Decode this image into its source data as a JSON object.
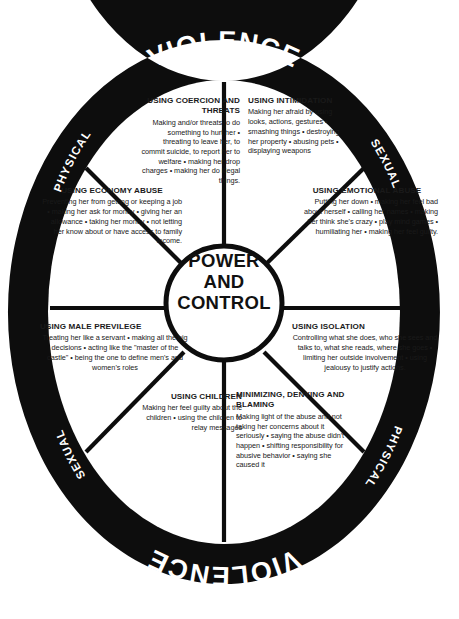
{
  "diagram": {
    "hub": {
      "line1": "POWER",
      "line2": "AND",
      "line3": "CONTROL"
    },
    "ring": {
      "top": {
        "main": "VIOLENCE",
        "left": "PHYSICAL",
        "right": "SEXUAL"
      },
      "bottom": {
        "main": "VIOLENCE",
        "left": "PHYSICAL",
        "right": "SEXUAL"
      }
    },
    "segments": [
      {
        "id": "coercion",
        "heading": "USING COERCION AND THREATS",
        "body": "Making and/or threats to do something to hurt her • threating to leave her, to commit suicide, to report her to welfare • making her drop charges • making her do illegal things.",
        "align": "right"
      },
      {
        "id": "intimidation",
        "heading": "USING INTIMIDATION",
        "body": "Making her afraid by using looks, actions, gestures • smashing things • destroying her property • abusing pets • displaying weapons",
        "align": "left"
      },
      {
        "id": "economy",
        "heading": "USING ECONOMY ABUSE",
        "body": "Preventing her from getting or keeping a job • making her ask for money • giving her an allowance • taking her money • not letting her know about or have  access to family income.",
        "align": "right"
      },
      {
        "id": "emotional",
        "heading": "USING EMOTIONAL ABUSE",
        "body": "Putting her down • making her feel bad about herself • calling her names • making her think she's crazy • play mind games • humiliating her • making her feel guilty.",
        "align": "right"
      },
      {
        "id": "male-privilege",
        "heading": "USING MALE PREVILEGE",
        "body": "Treating her like a servant • making all the big decisions • acting like the \"master of the castle\" • being the one to define men's and women's roles",
        "align": "center"
      },
      {
        "id": "isolation",
        "heading": "USING ISOLATION",
        "body": "Controlling what she does, who she sees and talks to, what she reads, where she goes • limiting her outside involvement • using jealousy to justify actions.",
        "align": "center"
      },
      {
        "id": "children",
        "heading": "USING CHILDREN",
        "body": "Making her feel guilty about the children • using the children to relay messages",
        "align": "right"
      },
      {
        "id": "minimizing",
        "heading": "MINIMIZING, DENYING AND BLAMING",
        "body": "Making light of the abuse and not taking her concerns about it seriously • saying the abuse didn't happen • shifting responsibility for abusive behavior • saying she caused it",
        "align": "left"
      }
    ],
    "colors": {
      "ring": "#0d0d0d",
      "background": "#ffffff",
      "text": "#1a1a1a",
      "ring_text": "#ffffff"
    }
  }
}
